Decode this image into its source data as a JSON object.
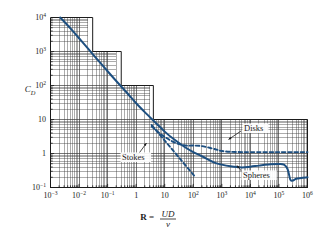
{
  "figure": {
    "background": "#ffffff",
    "curve_color": "#1d4f80",
    "grid_color": "#3a3a3a",
    "axis_color": "#1b1b1b"
  },
  "axes": {
    "x": {
      "label_prefix": "R",
      "label_equals": " = ",
      "label_numerator": "UD",
      "label_denominator": "ν",
      "ticks": [
        {
          "value": 0.001,
          "mantissa": "10",
          "exponent": "−3"
        },
        {
          "value": 0.01,
          "mantissa": "10",
          "exponent": "−2"
        },
        {
          "value": 0.1,
          "mantissa": "10",
          "exponent": "−1"
        },
        {
          "value": 1,
          "mantissa": "1",
          "exponent": ""
        },
        {
          "value": 10,
          "mantissa": "10",
          "exponent": ""
        },
        {
          "value": 100,
          "mantissa": "10",
          "exponent": "2"
        },
        {
          "value": 1000,
          "mantissa": "10",
          "exponent": "3"
        },
        {
          "value": 10000,
          "mantissa": "10",
          "exponent": "4"
        },
        {
          "value": 100000,
          "mantissa": "10",
          "exponent": "5"
        },
        {
          "value": 1000000,
          "mantissa": "10",
          "exponent": "6"
        }
      ]
    },
    "y": {
      "label_main": "C",
      "label_sub": "D",
      "ticks": [
        {
          "value": 0.1,
          "mantissa": "10",
          "exponent": "−1"
        },
        {
          "value": 1,
          "mantissa": "1",
          "exponent": ""
        },
        {
          "value": 10,
          "mantissa": "10",
          "exponent": ""
        },
        {
          "value": 100,
          "mantissa": "10",
          "exponent": "2"
        },
        {
          "value": 1000,
          "mantissa": "10",
          "exponent": "3"
        },
        {
          "value": 10000,
          "mantissa": "10",
          "exponent": "4"
        }
      ]
    }
  },
  "annotations": [
    {
      "id": "disks",
      "text": "Disks",
      "x": 244,
      "y": 131
    },
    {
      "id": "stokes",
      "text": "Stokes",
      "x": 122,
      "y": 160
    },
    {
      "id": "spheres",
      "text": "Spheres",
      "x": 243,
      "y": 178
    }
  ],
  "chart_data": {
    "type": "line",
    "title": "",
    "xlabel": "R = UD/ν",
    "ylabel": "C_D",
    "xscale": "log",
    "yscale": "log",
    "xlim": [
      0.001,
      1000000
    ],
    "ylim": [
      0.1,
      10000
    ],
    "grid": true,
    "grid_style": "log minor staircase envelope",
    "legend": "inline annotations",
    "series": [
      {
        "name": "Spheres",
        "style": "solid",
        "color": "#1d4f80",
        "points": [
          [
            0.0022,
            10000
          ],
          [
            0.005,
            4800
          ],
          [
            0.01,
            2450
          ],
          [
            0.02,
            1250
          ],
          [
            0.05,
            510
          ],
          [
            0.1,
            262
          ],
          [
            0.2,
            136
          ],
          [
            0.5,
            58
          ],
          [
            1,
            30
          ],
          [
            2,
            16.5
          ],
          [
            5,
            7.8
          ],
          [
            10,
            4.4
          ],
          [
            20,
            2.7
          ],
          [
            50,
            1.55
          ],
          [
            100,
            1.1
          ],
          [
            200,
            0.83
          ],
          [
            500,
            0.56
          ],
          [
            1000,
            0.47
          ],
          [
            2000,
            0.42
          ],
          [
            5000,
            0.39
          ],
          [
            10000,
            0.41
          ],
          [
            20000,
            0.44
          ],
          [
            50000,
            0.48
          ],
          [
            100000,
            0.49
          ],
          [
            150000,
            0.47
          ],
          [
            200000,
            0.35
          ],
          [
            250000,
            0.17
          ],
          [
            300000,
            0.16
          ],
          [
            400000,
            0.18
          ],
          [
            600000,
            0.19
          ],
          [
            1000000,
            0.2
          ]
        ]
      },
      {
        "name": "Disks",
        "style": "dashed",
        "color": "#1d4f80",
        "points": [
          [
            3.5,
            6.2
          ],
          [
            5,
            4.8
          ],
          [
            8,
            3.5
          ],
          [
            12,
            2.8
          ],
          [
            20,
            2.2
          ],
          [
            35,
            1.85
          ],
          [
            60,
            1.7
          ],
          [
            100,
            1.72
          ],
          [
            200,
            1.65
          ],
          [
            400,
            1.45
          ],
          [
            700,
            1.28
          ],
          [
            1000,
            1.18
          ],
          [
            2000,
            1.12
          ],
          [
            5000,
            1.1
          ],
          [
            10000,
            1.1
          ],
          [
            100000,
            1.1
          ],
          [
            1000000,
            1.1
          ]
        ]
      },
      {
        "name": "Stokes",
        "style": "dashed",
        "color": "#1d4f80",
        "description": "Stokes law C_D = 24/R",
        "points": [
          [
            3.5,
            6.85
          ],
          [
            10,
            2.4
          ],
          [
            30,
            0.8
          ],
          [
            100,
            0.24
          ],
          [
            120,
            0.2
          ]
        ]
      }
    ]
  }
}
